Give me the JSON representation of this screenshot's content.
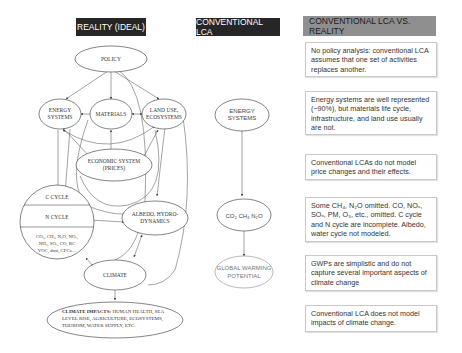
{
  "headers": {
    "reality": "REALITY (IDEAL)",
    "conventional": "CONVENTIONAL LCA",
    "comparison": "CONVENTIONAL LCA VS. REALITY"
  },
  "reality_nodes": {
    "policy": "POLICY",
    "energy_1": "ENERGY",
    "energy_2": "SYSTEMS",
    "materials": "MATERIALS",
    "landuse_1": "LAND USE,",
    "landuse_2": "ECOSYSTEMS",
    "economic_1": "ECONOMIC SYSTEM",
    "economic_2": "(PRICES)",
    "c_cycle": "C CYCLE",
    "n_cycle": "N CYCLE",
    "gases_1": "CO₂, CH₄, N₂O, NOₓ,",
    "gases_2": "NH₃, SOₓ, CO, BC",
    "gases_3": "VOC, dust, CFCs…",
    "albedo_1": "ALBEDO, HYDRO-",
    "albedo_2": "DYNAMICS",
    "climate": "CLIMATE",
    "impacts_bold": "CLIMATE IMPACTS:",
    "impacts_1": " HUMAN HEALTH, SEA",
    "impacts_2": "LEVEL RISE, AGRICULTURE, ECOSYSTEMS,",
    "impacts_3": "TOURISM, WATER SUPPLY, ETC."
  },
  "conventional_nodes": {
    "energy_1": "ENERGY",
    "energy_2": "SYSTEMS",
    "gases": "CO₂  CH₄  N₂O",
    "gwp_1": "GLOBAL WARMING",
    "gwp_2": "POTENTIAL"
  },
  "comparison_boxes": [
    "No policy analysis: conventional LCA assumes that one set of activities replaces another.",
    "Energy systems are well represented (~90%), but materials life cycle, infrastructure, and land use usually are not.",
    "Conventional LCAs do not model price changes and their effects.",
    "Some CH₄, N₂O omitted. CO, NOₓ, SOₓ, PM, O₃, etc., omitted. C cycle and N cycle are incomplete. Albedo, water cycle not modeled.",
    "GWPs are simplistic and do not capture several important aspects of climate change",
    "Conventional LCA does not model impacts of climate change."
  ],
  "colors": {
    "dark_header": "#262626",
    "gray_header": "#8f8f8f",
    "line": "#555555"
  }
}
